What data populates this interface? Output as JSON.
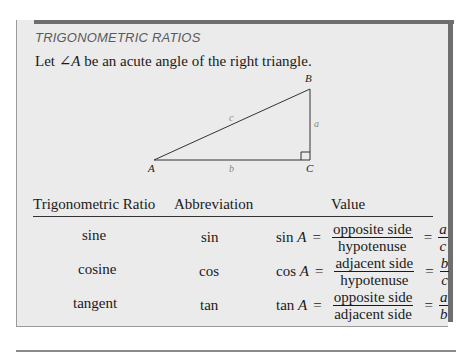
{
  "box": {
    "title": "TRIGONOMETRIC RATIOS",
    "intro_prefix": "Let ",
    "intro_angle": "∠A",
    "intro_suffix": " be an acute angle of the right triangle."
  },
  "triangle": {
    "vertices": {
      "A": "A",
      "B": "B",
      "C": "C"
    },
    "sides": {
      "hypotenuse": "c",
      "opposite": "a",
      "adjacent": "b"
    }
  },
  "table": {
    "headers": [
      "Trigonometric Ratio",
      "Abbreviation",
      "Value"
    ],
    "rows": [
      {
        "ratio": "sine",
        "abbr": "sin",
        "lhs_fn": "sin",
        "lhs_var": "A",
        "num": "opposite side",
        "den": "hypotenuse",
        "short_num": "a",
        "short_den": "c"
      },
      {
        "ratio": "cosine",
        "abbr": "cos",
        "lhs_fn": "cos",
        "lhs_var": "A",
        "num": "adjacent side",
        "den": "hypotenuse",
        "short_num": "b",
        "short_den": "c"
      },
      {
        "ratio": "tangent",
        "abbr": "tan",
        "lhs_fn": "tan",
        "lhs_var": "A",
        "num": "opposite side",
        "den": "adjacent side",
        "short_num": "a",
        "short_den": "b"
      }
    ],
    "equals": "="
  }
}
